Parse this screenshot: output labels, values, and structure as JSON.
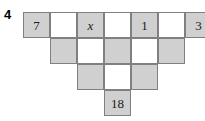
{
  "question_number": "4",
  "puzzle": {
    "type": "number-pyramid",
    "geometry": {
      "cell_w": 27,
      "cell_h": 26,
      "origin_x": 23,
      "origin_y": 12
    },
    "rows": [
      {
        "row_index": 0,
        "y": 12,
        "cells": [
          {
            "col": 0,
            "x": 23,
            "shaded": true,
            "value": "7",
            "italic": false
          },
          {
            "col": 1,
            "x": 50,
            "shaded": false,
            "value": "",
            "italic": false
          },
          {
            "col": 2,
            "x": 77,
            "shaded": true,
            "value": "x",
            "italic": true
          },
          {
            "col": 3,
            "x": 104,
            "shaded": false,
            "value": "",
            "italic": false
          },
          {
            "col": 4,
            "x": 131,
            "shaded": true,
            "value": "1",
            "italic": false
          },
          {
            "col": 5,
            "x": 158,
            "shaded": false,
            "value": "",
            "italic": false
          },
          {
            "col": 6,
            "x": 185,
            "shaded": true,
            "value": "3",
            "italic": false
          }
        ]
      },
      {
        "row_index": 1,
        "y": 38,
        "cells": [
          {
            "col": 0,
            "x": 50,
            "shaded": true,
            "value": "",
            "italic": false
          },
          {
            "col": 1,
            "x": 77,
            "shaded": false,
            "value": "",
            "italic": false
          },
          {
            "col": 2,
            "x": 104,
            "shaded": true,
            "value": "",
            "italic": false
          },
          {
            "col": 3,
            "x": 131,
            "shaded": false,
            "value": "",
            "italic": false
          },
          {
            "col": 4,
            "x": 158,
            "shaded": true,
            "value": "",
            "italic": false
          }
        ]
      },
      {
        "row_index": 2,
        "y": 64,
        "cells": [
          {
            "col": 0,
            "x": 77,
            "shaded": true,
            "value": "",
            "italic": false
          },
          {
            "col": 1,
            "x": 104,
            "shaded": false,
            "value": "",
            "italic": false
          },
          {
            "col": 2,
            "x": 131,
            "shaded": true,
            "value": "",
            "italic": false
          }
        ]
      },
      {
        "row_index": 3,
        "y": 90,
        "cells": [
          {
            "col": 0,
            "x": 104,
            "shaded": true,
            "value": "18",
            "italic": false
          }
        ]
      }
    ]
  },
  "colors": {
    "shaded_fill": "#d0d0d0",
    "empty_fill": "#ffffff",
    "border": "#808080",
    "text": "#1a1a1a",
    "background": "#ffffff"
  }
}
